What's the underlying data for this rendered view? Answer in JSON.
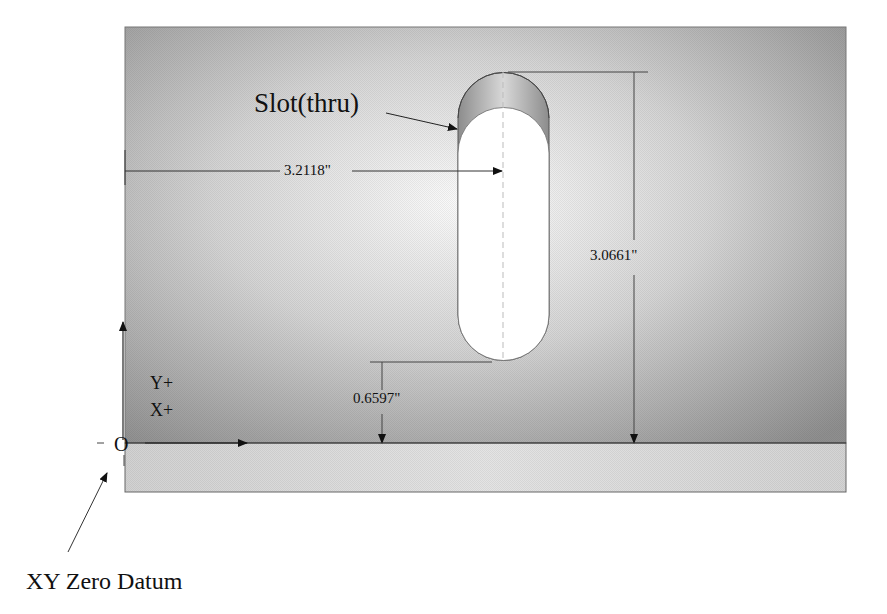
{
  "diagram": {
    "type": "machining-drawing",
    "feature_label": "Slot(thru)",
    "dimensions": {
      "x_to_slot_center": "3.2118\"",
      "slot_top_height": "3.0661\"",
      "slot_bottom_height": "0.6597\""
    },
    "axes": {
      "y_label": "Y+",
      "x_label": "X+",
      "origin_label": "O"
    },
    "datum_label": "XY Zero Datum",
    "colors": {
      "plate_top_light": "#f4f4f4",
      "plate_top_dark": "#9a9a9a",
      "plate_front": "#dcdcdc",
      "slot_wall": "#a8a8a8",
      "slot_hole": "#ffffff",
      "line": "#333333"
    }
  }
}
